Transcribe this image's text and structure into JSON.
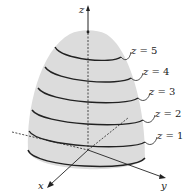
{
  "figure": {
    "surface_color": "#dcdcdc",
    "line_color": "#222222",
    "axes": {
      "z_label": "z",
      "y_label": "y",
      "x_label": "x"
    },
    "level_curves": [
      {
        "var": "z",
        "eq": " = 5"
      },
      {
        "var": "z",
        "eq": " = 4"
      },
      {
        "var": "z",
        "eq": " = 3"
      },
      {
        "var": "z",
        "eq": " = 2"
      },
      {
        "var": "z",
        "eq": " = 1"
      }
    ]
  }
}
